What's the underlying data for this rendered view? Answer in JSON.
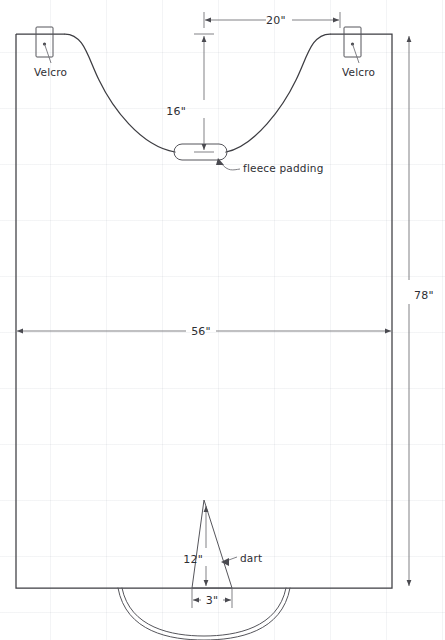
{
  "diagram": {
    "units": "inches",
    "line_color": "#3d3d42",
    "dimension_color": "#6a6a70",
    "background_color": "#ffffff",
    "grid_color": "#78829633"
  },
  "dimensions": [
    {
      "id": "neck-opening-width",
      "label": "20\"",
      "orientation": "horizontal",
      "value": 20
    },
    {
      "id": "neck-drop-depth",
      "label": "16\"",
      "orientation": "vertical",
      "value": 16
    },
    {
      "id": "overall-width",
      "label": "56\"",
      "orientation": "horizontal",
      "value": 56
    },
    {
      "id": "overall-height",
      "label": "78\"",
      "orientation": "vertical",
      "value": 78
    },
    {
      "id": "dart-height",
      "label": "12\"",
      "orientation": "vertical",
      "value": 12
    },
    {
      "id": "dart-base-width",
      "label": "3\"",
      "orientation": "horizontal",
      "value": 3
    }
  ],
  "annotations": [
    {
      "id": "velcro-left",
      "label": "Velcro"
    },
    {
      "id": "velcro-right",
      "label": "Velcro"
    },
    {
      "id": "fleece-padding",
      "label": "fleece padding"
    },
    {
      "id": "dart",
      "label": "dart"
    }
  ],
  "features": {
    "velcro_patch": "rectangular velcro tab straddling top edge",
    "fleece_padding": "rounded pill-shaped pad at base of neckline curve",
    "dart": "narrow triangular dart at bottom center",
    "hem_arc": "double curved hem arc below bottom edge",
    "neckline": "scooped neckline curve between velcro tabs"
  }
}
